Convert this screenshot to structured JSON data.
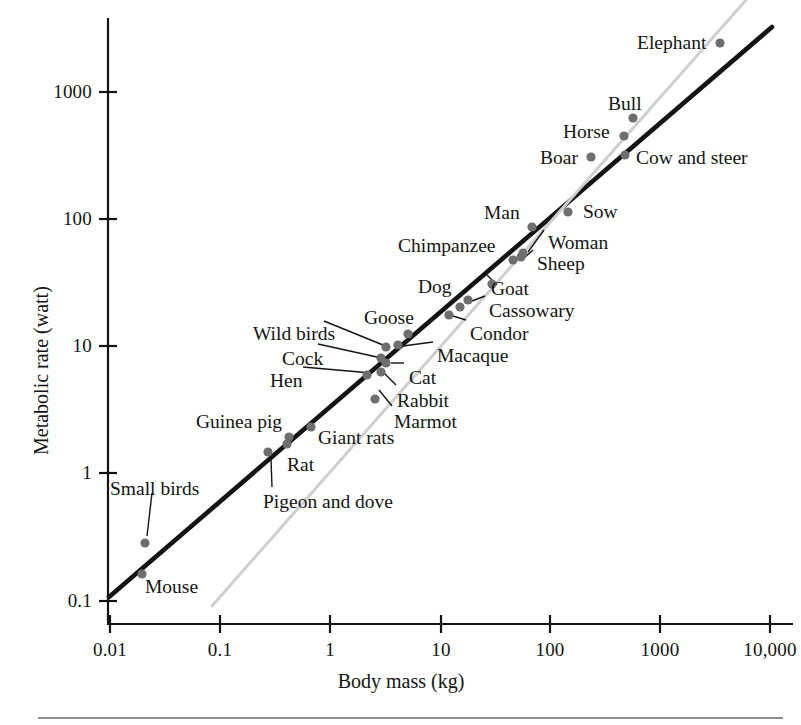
{
  "chart_data": {
    "type": "scatter",
    "title": "",
    "xlabel": "Body mass (kg)",
    "ylabel": "Metabolic rate (watt)",
    "xscale": "log",
    "yscale": "log",
    "xlim": [
      0.01,
      10000
    ],
    "ylim": [
      0.1,
      3000
    ],
    "grid": false,
    "legend": "none",
    "xticks": [
      "0.01",
      "0.1",
      "1",
      "10",
      "100",
      "1000",
      "10,000"
    ],
    "xtick_values": [
      0.01,
      0.1,
      1,
      10,
      100,
      1000,
      10000
    ],
    "yticks": [
      "0.1",
      "1",
      "10",
      "100",
      "1000"
    ],
    "ytick_values": [
      0.1,
      1,
      10,
      100,
      1000
    ],
    "points": [
      {
        "label": "Mouse",
        "x": 0.02,
        "y": 0.175,
        "px": 142,
        "py": 574
      },
      {
        "label": "Small birds",
        "x": 0.021,
        "y": 0.3,
        "px": 145,
        "py": 543
      },
      {
        "label": "Pigeon and dove",
        "x": 0.28,
        "y": 1.38,
        "px": 268,
        "py": 452
      },
      {
        "label": "Rat",
        "x": 0.38,
        "y": 1.7,
        "px": 287,
        "py": 444
      },
      {
        "label": "Guinea pig",
        "x": 0.4,
        "y": 1.95,
        "px": 289,
        "py": 437
      },
      {
        "label": "Giant rats",
        "x": 0.62,
        "y": 2.35,
        "px": 311,
        "py": 427
      },
      {
        "label": "Marmot",
        "x": 2.6,
        "y": 4.3,
        "px": 375,
        "py": 399
      },
      {
        "label": "Hen",
        "x": 2.1,
        "y": 5.5,
        "px": 367,
        "py": 375
      },
      {
        "label": "Rabbit",
        "x": 2.7,
        "y": 5.8,
        "px": 381,
        "py": 372
      },
      {
        "label": "Cat",
        "x": 2.9,
        "y": 6.6,
        "px": 386,
        "py": 363
      },
      {
        "label": "Cock",
        "x": 2.6,
        "y": 7.1,
        "px": 381,
        "py": 358
      },
      {
        "label": "Wild birds",
        "x": 2.8,
        "y": 8.7,
        "px": 386,
        "py": 347
      },
      {
        "label": "Macaque",
        "x": 3.6,
        "y": 9.0,
        "px": 398,
        "py": 345
      },
      {
        "label": "Goose",
        "x": 4.6,
        "y": 11.0,
        "px": 408,
        "py": 334
      },
      {
        "label": "Condor",
        "x": 9.5,
        "y": 16.0,
        "px": 449,
        "py": 315
      },
      {
        "label": "Dog",
        "x": 12.0,
        "y": 19.0,
        "px": 460,
        "py": 307
      },
      {
        "label": "Cassowary",
        "x": 14.0,
        "y": 22.0,
        "px": 468,
        "py": 300
      },
      {
        "label": "Goat",
        "x": 24.0,
        "y": 31.0,
        "px": 492,
        "py": 284
      },
      {
        "label": "Chimpanzee",
        "x": 38.0,
        "y": 48.0,
        "px": 513,
        "py": 260
      },
      {
        "label": "Sheep",
        "x": 46.0,
        "y": 51.0,
        "px": 521,
        "py": 257
      },
      {
        "label": "Woman",
        "x": 48.0,
        "y": 55.0,
        "px": 523,
        "py": 253
      },
      {
        "label": "Man",
        "x": 58.0,
        "y": 86.0,
        "px": 532,
        "py": 227
      },
      {
        "label": "Sow",
        "x": 125.0,
        "y": 115.0,
        "px": 568,
        "py": 212
      },
      {
        "label": "Boar",
        "x": 220.0,
        "y": 270.0,
        "px": 591,
        "py": 157
      },
      {
        "label": "Cow and steer",
        "x": 440.0,
        "y": 290.0,
        "px": 625,
        "py": 155
      },
      {
        "label": "Horse",
        "x": 430.0,
        "y": 390.0,
        "px": 624,
        "py": 136
      },
      {
        "label": "Bull",
        "x": 500.0,
        "y": 580.0,
        "px": 633,
        "py": 118
      },
      {
        "label": "Elephant",
        "x": 3400.0,
        "y": 2000.0,
        "px": 720,
        "py": 43
      }
    ],
    "lines": [
      {
        "name": "dark-regression-line",
        "color": "#141414",
        "width": 4.6,
        "x1": 109,
        "y1": 597,
        "x2": 772,
        "y2": 27
      },
      {
        "name": "light-reference-line",
        "color": "#cfcfcf",
        "width": 3.0,
        "x1": 212,
        "y1": 606,
        "x2": 746,
        "y2": 0
      }
    ],
    "point_color": "#6e6e6e",
    "point_radius": 4.6
  },
  "axes": {
    "x_title": "Body mass (kg)",
    "y_title": "Metabolic rate (watt)",
    "x_tick_labels": [
      {
        "text": "0.01",
        "px": 110
      },
      {
        "text": "0.1",
        "px": 220
      },
      {
        "text": "1",
        "px": 330
      },
      {
        "text": "10",
        "px": 441
      },
      {
        "text": "100",
        "px": 550
      },
      {
        "text": "1000",
        "px": 660
      },
      {
        "text": "10,000",
        "px": 770
      }
    ],
    "y_tick_labels": [
      {
        "text": "1000",
        "py": 92
      },
      {
        "text": "100",
        "py": 219
      },
      {
        "text": "10",
        "py": 346
      },
      {
        "text": "1",
        "py": 473
      },
      {
        "text": "0.1",
        "py": 601
      }
    ]
  },
  "annotations": [
    {
      "name": "small-birds",
      "text": "Small birds",
      "x": 110,
      "y": 479
    },
    {
      "name": "mouse",
      "text": "Mouse",
      "x": 145,
      "y": 577
    },
    {
      "name": "pigeon-and-dove",
      "text": "Pigeon and dove",
      "x": 263,
      "y": 492
    },
    {
      "name": "rat",
      "text": "Rat",
      "x": 287,
      "y": 455
    },
    {
      "name": "guinea-pig",
      "text": "Guinea pig",
      "x": 196,
      "y": 412
    },
    {
      "name": "giant-rats",
      "text": "Giant rats",
      "x": 318,
      "y": 428
    },
    {
      "name": "marmot",
      "text": "Marmot",
      "x": 394,
      "y": 412
    },
    {
      "name": "rabbit",
      "text": "Rabbit",
      "x": 397,
      "y": 391
    },
    {
      "name": "hen",
      "text": "Hen",
      "x": 270,
      "y": 371
    },
    {
      "name": "cat",
      "text": "Cat",
      "x": 409,
      "y": 368
    },
    {
      "name": "cock",
      "text": "Cock",
      "x": 282,
      "y": 349
    },
    {
      "name": "wild-birds",
      "text": "Wild birds",
      "x": 253,
      "y": 324
    },
    {
      "name": "macaque",
      "text": "Macaque",
      "x": 437,
      "y": 346
    },
    {
      "name": "goose",
      "text": "Goose",
      "x": 364,
      "y": 308
    },
    {
      "name": "condor",
      "text": "Condor",
      "x": 470,
      "y": 324
    },
    {
      "name": "cassowary",
      "text": "Cassowary",
      "x": 489,
      "y": 301
    },
    {
      "name": "dog",
      "text": "Dog",
      "x": 418,
      "y": 277
    },
    {
      "name": "goat",
      "text": "Goat",
      "x": 491,
      "y": 279
    },
    {
      "name": "sheep",
      "text": "Sheep",
      "x": 537,
      "y": 254
    },
    {
      "name": "chimpanzee",
      "text": "Chimpanzee",
      "x": 398,
      "y": 236
    },
    {
      "name": "woman",
      "text": "Woman",
      "x": 548,
      "y": 233
    },
    {
      "name": "man",
      "text": "Man",
      "x": 484,
      "y": 203
    },
    {
      "name": "sow",
      "text": "Sow",
      "x": 583,
      "y": 202
    },
    {
      "name": "boar",
      "text": "Boar",
      "x": 540,
      "y": 148
    },
    {
      "name": "cow-and-steer",
      "text": "Cow and steer",
      "x": 636,
      "y": 148
    },
    {
      "name": "horse",
      "text": "Horse",
      "x": 563,
      "y": 122
    },
    {
      "name": "bull",
      "text": "Bull",
      "x": 608,
      "y": 94
    },
    {
      "name": "elephant",
      "text": "Elephant",
      "x": 637,
      "y": 33
    }
  ],
  "leader_lines": [
    {
      "name": "leader-small-birds",
      "x1": 152,
      "y1": 493,
      "x2": 147,
      "y2": 536
    },
    {
      "name": "leader-pigeon-and-dove",
      "x1": 272,
      "y1": 487,
      "x2": 271,
      "y2": 459
    },
    {
      "name": "leader-marmot",
      "x1": 392,
      "y1": 406,
      "x2": 379,
      "y2": 390
    },
    {
      "name": "leader-rabbit",
      "x1": 396,
      "y1": 385,
      "x2": 384,
      "y2": 373
    },
    {
      "name": "leader-hen",
      "x1": 303,
      "y1": 367,
      "x2": 371,
      "y2": 373
    },
    {
      "name": "leader-cat",
      "x1": 404,
      "y1": 363,
      "x2": 391,
      "y2": 363
    },
    {
      "name": "leader-cock",
      "x1": 318,
      "y1": 344,
      "x2": 377,
      "y2": 357
    },
    {
      "name": "leader-wild-birds",
      "x1": 324,
      "y1": 321,
      "x2": 383,
      "y2": 345
    },
    {
      "name": "leader-macaque",
      "x1": 433,
      "y1": 342,
      "x2": 403,
      "y2": 346
    },
    {
      "name": "leader-condor",
      "x1": 466,
      "y1": 320,
      "x2": 453,
      "y2": 316
    },
    {
      "name": "leader-cassowary",
      "x1": 485,
      "y1": 296,
      "x2": 472,
      "y2": 301
    },
    {
      "name": "leader-goat",
      "x1": 487,
      "y1": 275,
      "x2": 497,
      "y2": 285
    },
    {
      "name": "leader-sheep",
      "x1": 533,
      "y1": 250,
      "x2": 524,
      "y2": 258
    },
    {
      "name": "leader-woman",
      "x1": 544,
      "y1": 230,
      "x2": 528,
      "y2": 252
    }
  ]
}
